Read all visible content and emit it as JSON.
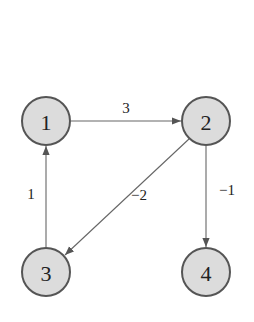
{
  "graph": {
    "type": "directed-weighted-graph",
    "nodes": [
      {
        "id": "1",
        "label": "1",
        "x": 46,
        "y": 121
      },
      {
        "id": "2",
        "label": "2",
        "x": 206,
        "y": 121
      },
      {
        "id": "3",
        "label": "3",
        "x": 46,
        "y": 272
      },
      {
        "id": "4",
        "label": "4",
        "x": 206,
        "y": 272
      }
    ],
    "edges": [
      {
        "from": "1",
        "to": "2",
        "weight": "3",
        "label_x": 126,
        "label_y": 108
      },
      {
        "from": "3",
        "to": "1",
        "weight": "1",
        "label_x": 31,
        "label_y": 194
      },
      {
        "from": "2",
        "to": "3",
        "weight": "−2",
        "label_x": 139,
        "label_y": 195
      },
      {
        "from": "2",
        "to": "4",
        "weight": "−1",
        "label_x": 226,
        "label_y": 190
      }
    ],
    "colors": {
      "node_fill": "#dcdcdc",
      "node_stroke": "#555555",
      "edge": "#666666",
      "text": "#222222"
    }
  }
}
